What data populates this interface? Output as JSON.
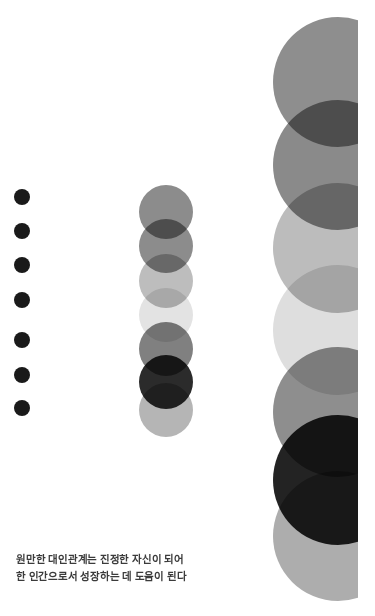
{
  "page": {
    "width": 375,
    "height": 616,
    "background_color": "#ffffff"
  },
  "caption": {
    "line1": "원만한 대인관계는 진정한 자신이 되어",
    "line2": "한 인간으로서 성장하는 데 도움이 된다",
    "text": "원만한 대인관계는 진정한 자신이 되어\n한 인간으로서 성장하는 데 도움이 된다",
    "color": "#3b3b3b",
    "font_size_px": 10.5,
    "font_weight": "bold"
  },
  "columns": [
    {
      "name": "left-dots",
      "description": "column of seven small solid dark dots",
      "center_x": 22,
      "diameter": 16,
      "count": 7,
      "circles": [
        {
          "cx": 22,
          "cy": 197,
          "r": 8,
          "color": "#1a1a1a",
          "opacity": 1
        },
        {
          "cx": 22,
          "cy": 231,
          "r": 8,
          "color": "#1a1a1a",
          "opacity": 1
        },
        {
          "cx": 22,
          "cy": 265,
          "r": 8,
          "color": "#1a1a1a",
          "opacity": 1
        },
        {
          "cx": 22,
          "cy": 300,
          "r": 8,
          "color": "#1a1a1a",
          "opacity": 1
        },
        {
          "cx": 22,
          "cy": 340,
          "r": 8,
          "color": "#1a1a1a",
          "opacity": 1
        },
        {
          "cx": 22,
          "cy": 375,
          "r": 8,
          "color": "#1a1a1a",
          "opacity": 1
        },
        {
          "cx": 22,
          "cy": 408,
          "r": 8,
          "color": "#1a1a1a",
          "opacity": 1
        }
      ]
    },
    {
      "name": "middle-circles",
      "description": "column of seven overlapping translucent gray circles",
      "center_x": 166,
      "diameter": 54,
      "count": 7,
      "circles": [
        {
          "cx": 166,
          "cy": 212,
          "r": 27,
          "color": "#8c8c8c",
          "opacity": 1
        },
        {
          "cx": 166,
          "cy": 246,
          "r": 27,
          "color": "#8c8c8c",
          "opacity": 1
        },
        {
          "cx": 166,
          "cy": 281,
          "r": 27,
          "color": "#bdbdbd",
          "opacity": 1
        },
        {
          "cx": 166,
          "cy": 315,
          "r": 27,
          "color": "#e3e3e3",
          "opacity": 1
        },
        {
          "cx": 166,
          "cy": 349,
          "r": 27,
          "color": "#808080",
          "opacity": 1
        },
        {
          "cx": 166,
          "cy": 382,
          "r": 27,
          "color": "#2b2b2b",
          "opacity": 1
        },
        {
          "cx": 166,
          "cy": 410,
          "r": 27,
          "color": "#b5b5b5",
          "opacity": 1
        }
      ]
    },
    {
      "name": "right-circles",
      "description": "column of seven large translucent circles clipped by the right page edge",
      "center_x": 338,
      "diameter": 130,
      "count": 7,
      "clip_right_x": 358,
      "circles": [
        {
          "cx": 338,
          "cy": 82,
          "r": 65,
          "color": "#8e8e8e",
          "opacity": 1
        },
        {
          "cx": 338,
          "cy": 165,
          "r": 65,
          "color": "#8a8a8a",
          "opacity": 1
        },
        {
          "cx": 338,
          "cy": 248,
          "r": 65,
          "color": "#bcbcbc",
          "opacity": 1
        },
        {
          "cx": 338,
          "cy": 330,
          "r": 65,
          "color": "#dedede",
          "opacity": 1
        },
        {
          "cx": 338,
          "cy": 412,
          "r": 65,
          "color": "#8e8e8e",
          "opacity": 1
        },
        {
          "cx": 338,
          "cy": 480,
          "r": 65,
          "color": "#232323",
          "opacity": 1
        },
        {
          "cx": 338,
          "cy": 536,
          "r": 65,
          "color": "#adadad",
          "opacity": 1
        }
      ]
    }
  ]
}
